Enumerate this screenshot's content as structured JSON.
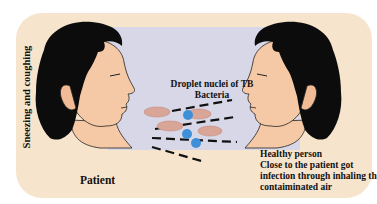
{
  "diagram": {
    "side_label": "Sneezing and coughing",
    "patient_label": "Patient",
    "droplet_label_line1": "Droplet  nuclei of TB",
    "droplet_label_line2": "Bacteria",
    "healthy": {
      "title": "Healthy person",
      "line1": "Close to the patient got",
      "line2": "infection through inhaling the",
      "line3": "contaiminated air"
    },
    "colors": {
      "panel": "#f7e4cd",
      "air": "#d7d7e7",
      "skin": "#f6c9a6",
      "hair": "#0c0c0c",
      "bacteria": "#d9a597",
      "droplet": "#3f8fd8"
    },
    "icons": [
      "patient-head",
      "healthy-person-head",
      "tb-bacteria",
      "droplet",
      "airflow-dashes"
    ]
  }
}
